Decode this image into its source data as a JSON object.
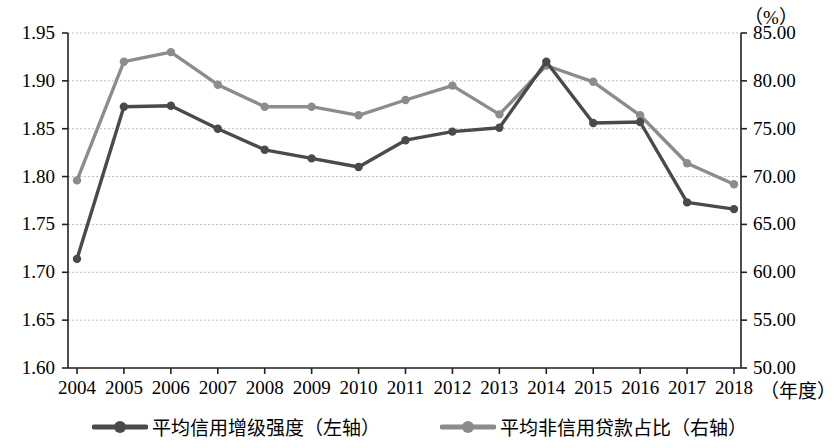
{
  "chart_data": {
    "type": "line",
    "title": "",
    "xlabel": "（年度）",
    "ylabel": "",
    "y2label": "（%）",
    "grid": true,
    "legend_position": "bottom",
    "categories": [
      "2004",
      "2005",
      "2006",
      "2007",
      "2008",
      "2009",
      "2010",
      "2011",
      "2012",
      "2013",
      "2014",
      "2015",
      "2016",
      "2017",
      "2018"
    ],
    "ylim": [
      1.6,
      1.95
    ],
    "yticks": [
      "1.60",
      "1.65",
      "1.70",
      "1.75",
      "1.80",
      "1.85",
      "1.90",
      "1.95"
    ],
    "y2lim": [
      50.0,
      85.0
    ],
    "y2ticks": [
      "50.00",
      "55.00",
      "60.00",
      "65.00",
      "70.00",
      "75.00",
      "80.00",
      "85.00"
    ],
    "series": [
      {
        "name": "平均信用增级强度（左轴）",
        "axis": "left",
        "color": "#4a4a4a",
        "values": [
          1.714,
          1.873,
          1.874,
          1.85,
          1.828,
          1.819,
          1.81,
          1.838,
          1.847,
          1.851,
          1.92,
          1.856,
          1.857,
          1.773,
          1.766
        ]
      },
      {
        "name": "平均非信用贷款占比（右轴）",
        "axis": "right",
        "color": "#8c8c8c",
        "values": [
          69.6,
          82.0,
          83.0,
          79.6,
          77.3,
          77.3,
          76.4,
          78.0,
          79.5,
          76.5,
          81.6,
          79.9,
          76.4,
          71.4,
          69.2
        ]
      }
    ]
  },
  "legend": {
    "items": [
      {
        "label": "平均信用增级强度（左轴）",
        "color": "#4a4a4a"
      },
      {
        "label": "平均非信用贷款占比（右轴）",
        "color": "#8c8c8c"
      }
    ]
  },
  "axes": {
    "right_unit": "（%）",
    "x_unit": "（年度）"
  }
}
